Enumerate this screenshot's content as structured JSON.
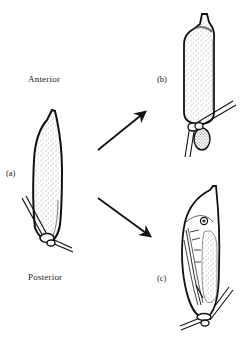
{
  "labels": {
    "anterior": "Anterior",
    "posterior": "Posterior",
    "panel_a": "(a)",
    "panel_b": "(b)",
    "panel_c": "(c)"
  },
  "panels": [
    {
      "id": "a",
      "description": "cocoon attached to stem, initial state",
      "icon": "cocoon-icon"
    },
    {
      "id": "b",
      "description": "elongated cocoon with bulge near attachment",
      "icon": "cocoon-bulge-icon"
    },
    {
      "id": "c",
      "description": "cocoon with developing pupa visible inside",
      "icon": "pupa-icon"
    }
  ],
  "arrows": [
    {
      "from": "a",
      "to": "b",
      "direction": "up-right"
    },
    {
      "from": "a",
      "to": "c",
      "direction": "down-right"
    }
  ],
  "colors": {
    "ink": "#111111",
    "stipple": "#555555",
    "background": "#ffffff"
  }
}
